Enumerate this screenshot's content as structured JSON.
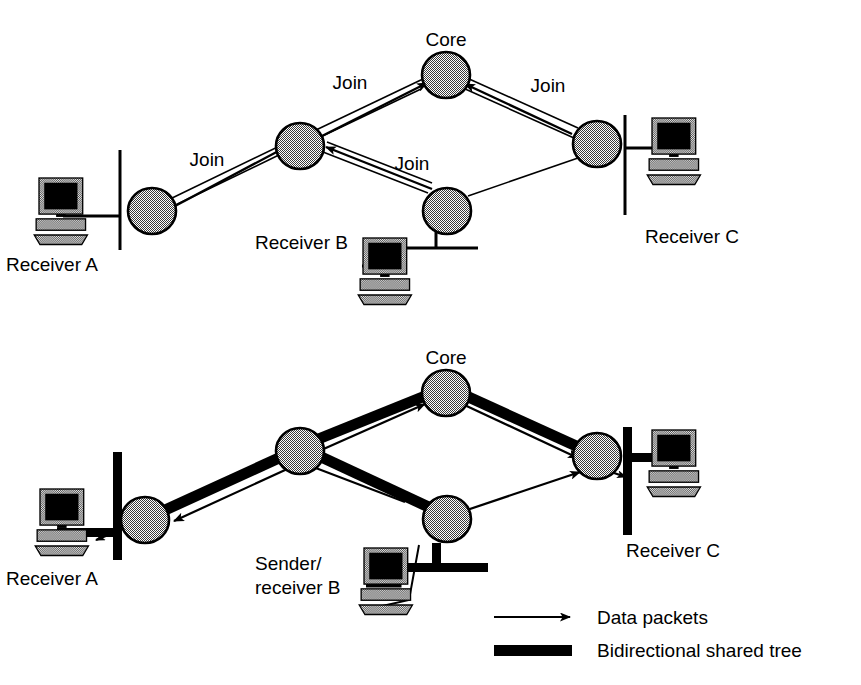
{
  "figure": {
    "background_color": "#ffffff",
    "ink_color": "#000000",
    "node_fill_color": "#b0b0b0"
  },
  "panels": [
    {
      "id": "top",
      "caption": "Join messages travelling toward the core",
      "nodes": [
        {
          "id": "core",
          "label": "Core",
          "label_position": "above"
        },
        {
          "id": "r_mid",
          "label": "",
          "label_position": "none"
        },
        {
          "id": "r_left",
          "label": "",
          "label_position": "none"
        },
        {
          "id": "r_low",
          "label": "",
          "label_position": "none"
        },
        {
          "id": "r_right",
          "label": "",
          "label_position": "none"
        }
      ],
      "hosts": [
        {
          "id": "recv_a",
          "label": "Receiver A",
          "label_position": "below-left"
        },
        {
          "id": "recv_b",
          "label": "Receiver B",
          "label_position": "left"
        },
        {
          "id": "recv_c",
          "label": "Receiver C",
          "label_position": "below"
        }
      ],
      "edge_labels": [
        {
          "id": "join_left_core",
          "text": "Join"
        },
        {
          "id": "join_right_core",
          "text": "Join"
        },
        {
          "id": "join_a_mid",
          "text": "Join"
        },
        {
          "id": "join_b_mid",
          "text": "Join"
        }
      ]
    },
    {
      "id": "bottom",
      "caption": "Data packets flowing over the bidirectional shared tree",
      "nodes": [
        {
          "id": "core",
          "label": "Core",
          "label_position": "above"
        },
        {
          "id": "r_mid",
          "label": "",
          "label_position": "none"
        },
        {
          "id": "r_left",
          "label": "",
          "label_position": "none"
        },
        {
          "id": "r_low",
          "label": "",
          "label_position": "none"
        },
        {
          "id": "r_right",
          "label": "",
          "label_position": "none"
        }
      ],
      "hosts": [
        {
          "id": "recv_a",
          "label": "Receiver A",
          "label_position": "below-left"
        },
        {
          "id": "sender_b",
          "label_line1": "Sender/",
          "label_line2": "receiver B",
          "label_position": "left"
        },
        {
          "id": "recv_c",
          "label": "Receiver C",
          "label_position": "below"
        }
      ],
      "edge_labels": []
    }
  ],
  "legend": {
    "items": [
      {
        "id": "data-packets",
        "symbol": "thin-arrow",
        "label": "Data packets"
      },
      {
        "id": "bidirectional-tree",
        "symbol": "thick-bar",
        "label": "Bidirectional shared tree"
      }
    ]
  }
}
